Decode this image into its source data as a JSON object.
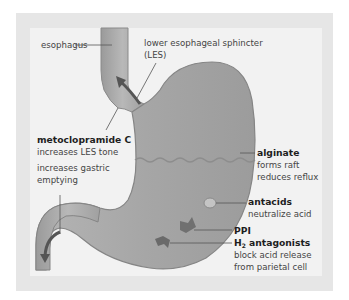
{
  "diagram": {
    "colors": {
      "frame": "#e6e6e6",
      "panel": "#f2f2f2",
      "stomach_fill": "#a9a9a9",
      "stomach_outline": "#8a8a8a",
      "arrow": "#5a5a5a",
      "text_bold": "#1e1e1e",
      "text": "#444444"
    },
    "labels": {
      "esophagus": "esophagus",
      "les_line1": "lower esophageal sphincter",
      "les_line2": "(LES)",
      "metoclopramide_title": "metoclopramide C",
      "metoclopramide_effect1": "increases LES tone",
      "metoclopramide_effect2_line1": "increases gastric",
      "metoclopramide_effect2_line2": "emptying",
      "alginate_title": "alginate",
      "alginate_line1": "forms raft",
      "alginate_line2": "reduces reflux",
      "antacids_title": "antacids",
      "antacids_line1": "neutralize acid",
      "ppi_title": "PPI",
      "h2_title_prefix": "H",
      "h2_sub": "2",
      "h2_title_suffix": " antagonists",
      "h2_line1": "block acid release",
      "h2_line2": "from parietal cell"
    }
  }
}
